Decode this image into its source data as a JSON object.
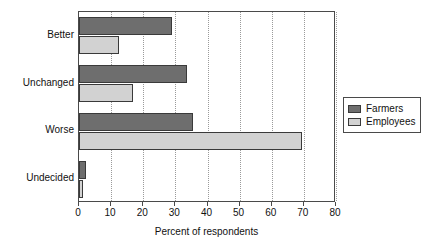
{
  "chart_data": {
    "type": "bar",
    "orientation": "horizontal",
    "title": "",
    "xlabel": "Percent of respondents",
    "ylabel": "",
    "xlim": [
      0,
      80
    ],
    "xticks": [
      0,
      10,
      20,
      30,
      40,
      50,
      60,
      70,
      80
    ],
    "xtick_labels": [
      "0",
      "10",
      "20",
      "30",
      "40",
      "50",
      "60",
      "70",
      "80"
    ],
    "grid": "vertical-dotted",
    "legend_position": "right",
    "categories": [
      "Better",
      "Unchanged",
      "Worse",
      "Undecided"
    ],
    "series": [
      {
        "name": "Farmers",
        "color": "#6e6e6e",
        "values": [
          29,
          33.5,
          35.5,
          2.2
        ]
      },
      {
        "name": "Employees",
        "color": "#d2d2d2",
        "values": [
          12.5,
          16.8,
          69.5,
          1.2
        ]
      }
    ]
  },
  "legend": {
    "entries": [
      {
        "label": "Farmers",
        "color": "#6e6e6e"
      },
      {
        "label": "Employees",
        "color": "#d2d2d2"
      }
    ]
  },
  "axis": {
    "x_title": "Percent of respondents"
  }
}
